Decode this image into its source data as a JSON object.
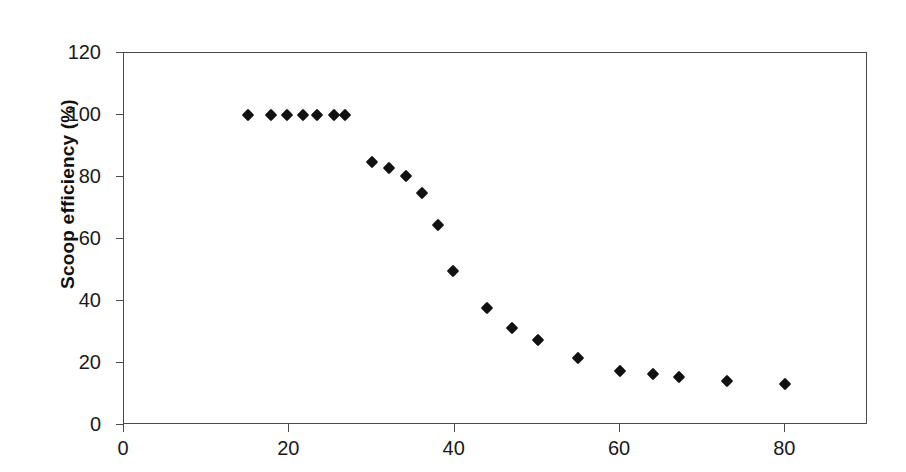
{
  "chart_data": {
    "type": "scatter",
    "title": "",
    "subtitle": "",
    "xlabel": "",
    "ylabel": "Scoop efficiency (%)",
    "xlim": [
      0,
      90
    ],
    "ylim": [
      0,
      120
    ],
    "xticks": [
      0,
      20,
      40,
      60,
      80
    ],
    "xtick_labels": [
      "0",
      "20",
      "40",
      "60",
      "80"
    ],
    "yticks": [
      0,
      20,
      40,
      60,
      80,
      100,
      120
    ],
    "ytick_labels": [
      "0",
      "20",
      "40",
      "60",
      "80",
      "100",
      "120"
    ],
    "grid": false,
    "legend": null,
    "marker": "diamond",
    "marker_color": "#111111",
    "axis_color": "#4a4a4a",
    "series": [
      {
        "name": "Scoop efficiency",
        "points": [
          {
            "x": 15.0,
            "y": 100.0
          },
          {
            "x": 17.8,
            "y": 100.0
          },
          {
            "x": 19.7,
            "y": 100.0
          },
          {
            "x": 21.6,
            "y": 100.0
          },
          {
            "x": 23.4,
            "y": 100.0
          },
          {
            "x": 25.4,
            "y": 100.0
          },
          {
            "x": 26.7,
            "y": 100.0
          },
          {
            "x": 30.0,
            "y": 84.8
          },
          {
            "x": 32.0,
            "y": 82.8
          },
          {
            "x": 34.1,
            "y": 80.3
          },
          {
            "x": 36.0,
            "y": 74.8
          },
          {
            "x": 38.0,
            "y": 64.6
          },
          {
            "x": 39.8,
            "y": 49.8
          },
          {
            "x": 43.9,
            "y": 37.6
          },
          {
            "x": 46.9,
            "y": 31.4
          },
          {
            "x": 50.1,
            "y": 27.5
          },
          {
            "x": 54.9,
            "y": 21.5
          },
          {
            "x": 60.0,
            "y": 17.3
          },
          {
            "x": 64.0,
            "y": 16.3
          },
          {
            "x": 67.1,
            "y": 15.4
          },
          {
            "x": 72.9,
            "y": 14.2
          },
          {
            "x": 80.0,
            "y": 13.2
          }
        ]
      }
    ]
  }
}
